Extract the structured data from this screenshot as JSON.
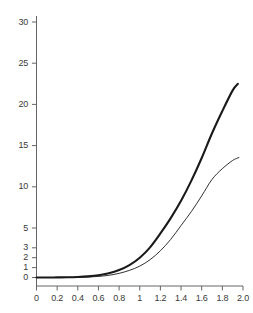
{
  "chart_data": {
    "type": "line",
    "title": "",
    "xlabel": "",
    "ylabel": "",
    "xlim": [
      0,
      2.0
    ],
    "ylim": [
      0,
      30
    ],
    "grid": false,
    "legend": "none",
    "x_ticks": [
      {
        "value": 0,
        "label": "0"
      },
      {
        "value": 0.2,
        "label": "0.2"
      },
      {
        "value": 0.4,
        "label": "0.4"
      },
      {
        "value": 0.6,
        "label": "0.6"
      },
      {
        "value": 0.8,
        "label": "0.8"
      },
      {
        "value": 1.0,
        "label": "1"
      },
      {
        "value": 1.2,
        "label": "1.2"
      },
      {
        "value": 1.4,
        "label": "1.4"
      },
      {
        "value": 1.6,
        "label": "1.6"
      },
      {
        "value": 1.8,
        "label": "1.8"
      },
      {
        "value": 2.0,
        "label": "2.0"
      }
    ],
    "y_ticks": [
      {
        "value": 0,
        "label": "0"
      },
      {
        "value": 1,
        "label": "1"
      },
      {
        "value": 2,
        "label": "2"
      },
      {
        "value": 3,
        "label": "3"
      },
      {
        "value": 5,
        "label": "5"
      },
      {
        "value": 10,
        "label": "10"
      },
      {
        "value": 15,
        "label": "15"
      },
      {
        "value": 20,
        "label": "20"
      },
      {
        "value": 25,
        "label": "25"
      },
      {
        "value": 30,
        "label": "30"
      }
    ],
    "axis_color": "#555555",
    "series": [
      {
        "name": "upper-curve",
        "style": "thick",
        "color": "#1a1a1a",
        "width": 2.1,
        "x": [
          0.0,
          0.1,
          0.2,
          0.3,
          0.4,
          0.5,
          0.6,
          0.7,
          0.8,
          0.9,
          1.0,
          1.1,
          1.2,
          1.3,
          1.4,
          1.5,
          1.6,
          1.7,
          1.8,
          1.9,
          1.95
        ],
        "y": [
          0.0,
          0.0,
          0.01,
          0.02,
          0.05,
          0.11,
          0.22,
          0.42,
          0.75,
          1.25,
          2.0,
          3.05,
          4.45,
          6.2,
          8.3,
          10.75,
          13.5,
          16.5,
          19.2,
          21.7,
          22.5
        ]
      },
      {
        "name": "lower-curve",
        "style": "thin",
        "color": "#1a1a1a",
        "width": 0.9,
        "x": [
          0.0,
          0.1,
          0.2,
          0.3,
          0.4,
          0.5,
          0.6,
          0.7,
          0.8,
          0.9,
          1.0,
          1.1,
          1.2,
          1.3,
          1.4,
          1.5,
          1.6,
          1.7,
          1.8,
          1.9,
          1.96
        ],
        "y": [
          0.0,
          0.0,
          0.0,
          0.01,
          0.02,
          0.05,
          0.11,
          0.22,
          0.42,
          0.72,
          1.15,
          1.8,
          2.7,
          3.85,
          5.3,
          7.0,
          8.9,
          10.9,
          12.2,
          13.2,
          13.55
        ]
      }
    ]
  }
}
